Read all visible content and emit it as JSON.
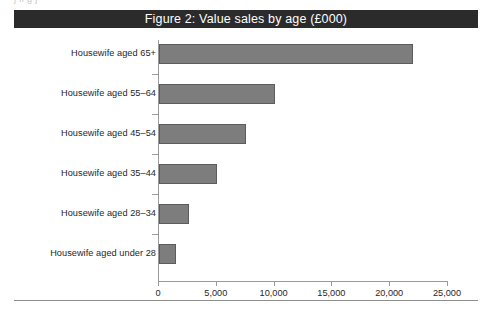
{
  "page": {
    "top_bleed_text": "j        ll     g   j"
  },
  "figure": {
    "title": "Figure 2: Value sales by age (£000)",
    "title_bar_color": "#2b2b2b",
    "title_text_color": "#ffffff"
  },
  "chart_data": {
    "type": "bar",
    "orientation": "horizontal",
    "title": "Figure 2: Value sales by age (£000)",
    "categories": [
      "Housewife aged 65+",
      "Housewife aged 55–64",
      "Housewife aged 45–54",
      "Housewife aged 35–44",
      "Housewife aged 28–34",
      "Housewife aged under 28"
    ],
    "values": [
      22000,
      10000,
      7500,
      5000,
      2600,
      1500
    ],
    "xlabel": "",
    "ylabel": "",
    "xlim": [
      0,
      25000
    ],
    "xticks": [
      0,
      5000,
      10000,
      15000,
      20000,
      25000
    ],
    "xtick_labels": [
      "0",
      "5,000",
      "10,000",
      "15,000",
      "20,000",
      "25,000"
    ],
    "grid": false,
    "legend": false,
    "bar_color": "#7d7d7d",
    "bar_border_color": "#5c5c5c",
    "axis_color": "#9a9a9a"
  }
}
